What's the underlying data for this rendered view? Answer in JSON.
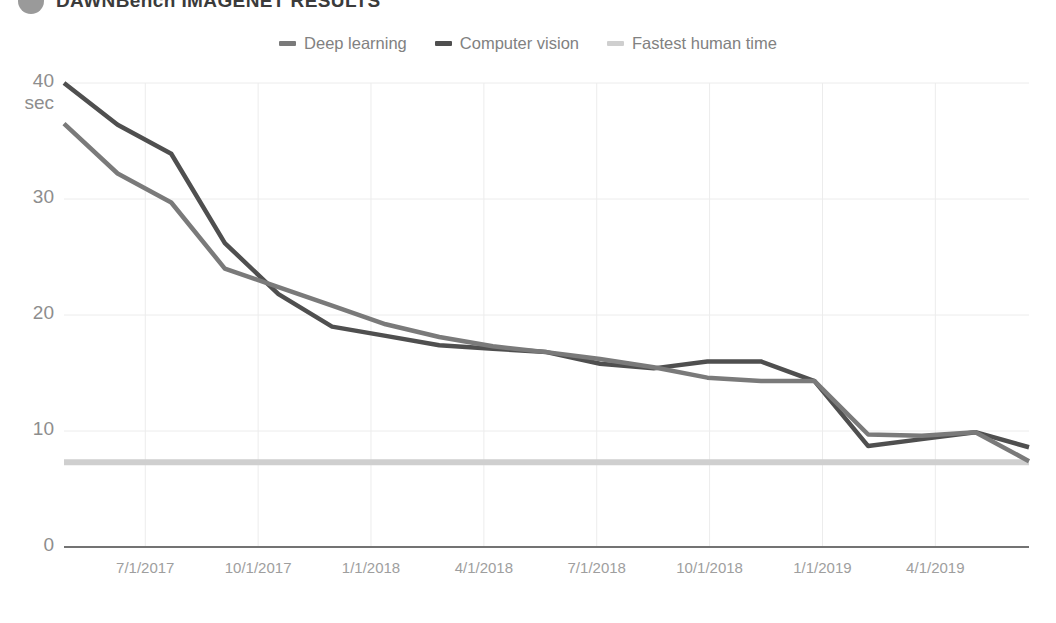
{
  "header": {
    "title": "DAWNBench IMAGENET RESULTS",
    "badge_icon": "circle-badge-icon"
  },
  "legend": {
    "position": "top-center",
    "items": [
      {
        "label": "Deep learning",
        "color": "#7a7a7a",
        "swatch_icon": "line-swatch-icon"
      },
      {
        "label": "Computer vision",
        "color": "#4f4f4f",
        "swatch_icon": "line-swatch-icon"
      },
      {
        "label": "Fastest human time",
        "color": "#cfcfcf",
        "swatch_icon": "line-swatch-icon"
      }
    ]
  },
  "axes": {
    "y_unit": "sec",
    "y_ticks": [
      "40",
      "30",
      "20",
      "10",
      "0"
    ],
    "x_ticks": [
      "7/1/2017",
      "10/1/2017",
      "1/1/2018",
      "4/1/2018",
      "7/1/2018",
      "10/1/2018",
      "1/1/2019",
      "4/1/2019"
    ]
  },
  "colors": {
    "deep_learning": "#7a7a7a",
    "computer_vision": "#4f4f4f",
    "human_time": "#cfcfcf",
    "gridline": "#ececec",
    "axis": "#737373",
    "text": "#8d8d8d"
  },
  "chart_data": {
    "type": "line",
    "title": "DAWNBench IMAGENET RESULTS",
    "xlabel": "",
    "ylabel": "sec",
    "ylim": [
      0,
      40
    ],
    "yticks": [
      0,
      10,
      20,
      30,
      40
    ],
    "grid": true,
    "legend_position": "top-center",
    "x": [
      "4/15/2017",
      "7/1/2017",
      "8/15/2017",
      "10/1/2017",
      "11/15/2017",
      "1/1/2018",
      "2/15/2018",
      "4/1/2018",
      "5/15/2018",
      "7/1/2018",
      "8/15/2018",
      "10/1/2018",
      "11/15/2018",
      "1/1/2019",
      "2/1/2019",
      "3/1/2019",
      "4/1/2019",
      "5/15/2019",
      "6/15/2019"
    ],
    "xticks": [
      "7/1/2017",
      "10/1/2017",
      "1/1/2018",
      "4/1/2018",
      "7/1/2018",
      "10/1/2018",
      "1/1/2019",
      "4/1/2019"
    ],
    "series": [
      {
        "name": "Computer vision",
        "color": "#4f4f4f",
        "values": [
          40.0,
          36.4,
          33.9,
          26.2,
          21.8,
          19.0,
          18.2,
          17.4,
          17.1,
          16.8,
          15.8,
          15.4,
          16.0,
          16.0,
          14.3,
          8.7,
          9.3,
          9.9,
          8.6
        ]
      },
      {
        "name": "Deep learning",
        "color": "#7a7a7a",
        "values": [
          36.5,
          32.2,
          29.7,
          24.0,
          22.4,
          20.8,
          19.2,
          18.1,
          17.3,
          16.8,
          16.2,
          15.5,
          14.6,
          14.3,
          14.3,
          9.7,
          9.6,
          9.9,
          7.4
        ]
      },
      {
        "name": "Fastest human time",
        "color": "#cfcfcf",
        "constant": 7.3,
        "values": [
          7.3,
          7.3,
          7.3,
          7.3,
          7.3,
          7.3,
          7.3,
          7.3,
          7.3,
          7.3,
          7.3,
          7.3,
          7.3,
          7.3,
          7.3,
          7.3,
          7.3,
          7.3,
          7.3
        ]
      }
    ]
  }
}
